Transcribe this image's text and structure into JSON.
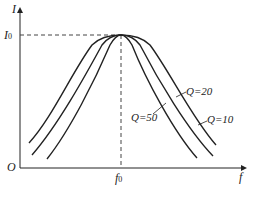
{
  "diagram": {
    "axes": {
      "y_label": "I",
      "x_label": "f",
      "origin_label": "O",
      "y_marker": {
        "base": "I",
        "sub": "0"
      },
      "x_marker": {
        "base": "f",
        "sub": "0"
      }
    },
    "curves": [
      {
        "label": "Q=50",
        "q": 50
      },
      {
        "label": "Q=20",
        "q": 20
      },
      {
        "label": "Q=10",
        "q": 10
      }
    ],
    "colors": {
      "line": "#222222",
      "dash": "#444444",
      "background": "#ffffff"
    }
  }
}
